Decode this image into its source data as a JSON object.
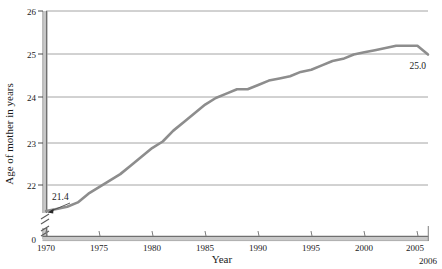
{
  "chart_data": {
    "type": "line",
    "title": "",
    "xlabel": "Year",
    "ylabel": "Age of mother in years",
    "xlim": [
      1970,
      2006
    ],
    "ylim": [
      21.3,
      26.0
    ],
    "y_axis_broken": true,
    "y_break_label": "0",
    "grid": true,
    "grid_axis": "y",
    "legend": "none",
    "line_color": "#8d8d8d",
    "x_ticks": [
      1970,
      1975,
      1980,
      1985,
      1990,
      1995,
      2000,
      2005
    ],
    "x_tick_labels": [
      "1970",
      "1975",
      "1980",
      "1985",
      "1990",
      "1995",
      "2000",
      "2005"
    ],
    "x_end_label": "2006",
    "y_ticks": [
      22,
      23,
      24,
      25,
      26
    ],
    "y_tick_labels": [
      "22",
      "23",
      "24",
      "25",
      "26"
    ],
    "annotations": [
      {
        "name": "start-value",
        "text": "21.4",
        "x": 1970,
        "y": 21.4
      },
      {
        "name": "end-value",
        "text": "25.0",
        "x": 2006,
        "y": 25.0
      }
    ],
    "x": [
      1970,
      1971,
      1972,
      1973,
      1974,
      1975,
      1976,
      1977,
      1978,
      1979,
      1980,
      1981,
      1982,
      1983,
      1984,
      1985,
      1986,
      1987,
      1988,
      1989,
      1990,
      1991,
      1992,
      1993,
      1994,
      1995,
      1996,
      1997,
      1998,
      1999,
      2000,
      2001,
      2002,
      2003,
      2004,
      2005,
      2006
    ],
    "values": [
      21.4,
      21.45,
      21.5,
      21.6,
      21.8,
      21.95,
      22.1,
      22.25,
      22.45,
      22.65,
      22.85,
      23.0,
      23.25,
      23.45,
      23.65,
      23.85,
      24.0,
      24.1,
      24.2,
      24.2,
      24.3,
      24.4,
      24.45,
      24.5,
      24.6,
      24.65,
      24.75,
      24.85,
      24.9,
      25.0,
      25.05,
      25.1,
      25.15,
      25.2,
      25.2,
      25.2,
      25.0
    ]
  }
}
